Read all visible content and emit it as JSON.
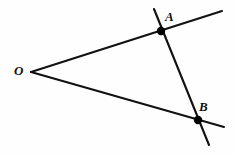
{
  "figure": {
    "kind": "geometry-diagram",
    "width": 235,
    "height": 156,
    "background_color": "#fefefe",
    "stroke_color": "#111111",
    "point_fill_color": "#000000",
    "labels": {
      "vertex": "O",
      "upper_intersection": "A",
      "lower_intersection": "B"
    },
    "points": {
      "O": {
        "x": 31,
        "y": 72
      },
      "A": {
        "x": 161,
        "y": 31
      },
      "B": {
        "x": 198,
        "y": 120
      }
    },
    "segments": [
      {
        "name": "upper-ray",
        "from": {
          "x": 31,
          "y": 72
        },
        "to": {
          "x": 222,
          "y": 11
        },
        "stroke_width": 2.1
      },
      {
        "name": "lower-ray",
        "from": {
          "x": 31,
          "y": 72
        },
        "to": {
          "x": 224,
          "y": 127
        },
        "stroke_width": 2.1
      },
      {
        "name": "transversal-line",
        "from": {
          "x": 154,
          "y": 9
        },
        "to": {
          "x": 209,
          "y": 145
        },
        "stroke_width": 2.1
      }
    ],
    "dot_radius": 4.2
  }
}
